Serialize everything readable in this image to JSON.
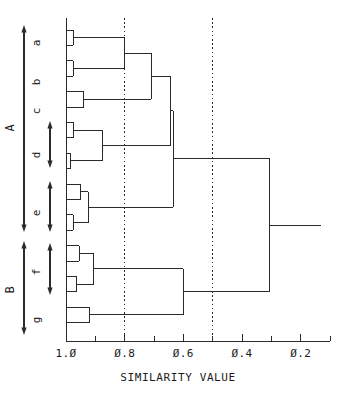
{
  "figure": {
    "type": "dendrogram",
    "background_color": "#ffffff",
    "line_color": "#2b2b2b",
    "width": 353,
    "height": 397
  },
  "axis": {
    "title": "SIMILARITY VALUE",
    "orientation": "horizontal-bottom",
    "direction": "decreasing-left-to-right",
    "tick_labels": [
      "1.0",
      "0.8",
      "0.6",
      "0.4",
      "0.2"
    ],
    "major_tick_values": [
      1.0,
      0.8,
      0.6,
      0.4,
      0.2
    ],
    "minor_tick_values": [
      0.9,
      0.7,
      0.5,
      0.3,
      0.1
    ],
    "axis_min": 1.0,
    "axis_max": 0.1,
    "zero_glyph": "slashed-zero"
  },
  "reference_lines": [
    {
      "name": "threshold-0-8",
      "value": 0.8,
      "style": "dotted"
    },
    {
      "name": "threshold-0-5",
      "value": 0.5,
      "style": "dotted"
    }
  ],
  "group_brackets": [
    {
      "label": "A",
      "name": "group-bracket-A",
      "style": "double-arrow"
    },
    {
      "label": "B",
      "name": "group-bracket-B",
      "style": "double-arrow"
    }
  ],
  "cluster_labels": [
    {
      "label": "a",
      "name": "cluster-label-a",
      "bracket": false
    },
    {
      "label": "b",
      "name": "cluster-label-b",
      "bracket": false
    },
    {
      "label": "c",
      "name": "cluster-label-c",
      "bracket": false
    },
    {
      "label": "d",
      "name": "cluster-label-d",
      "bracket": true
    },
    {
      "label": "e",
      "name": "cluster-label-e",
      "bracket": true
    },
    {
      "label": "f",
      "name": "cluster-label-f",
      "bracket": true
    },
    {
      "label": "g",
      "name": "cluster-label-g",
      "bracket": false
    }
  ],
  "chart_data": {
    "type": "line",
    "title": "",
    "subtitle": "",
    "xlabel": "SIMILARITY VALUE",
    "ylabel": "",
    "xlim": [
      1.0,
      0.1
    ],
    "ylim": [
      0,
      26
    ],
    "grid": false,
    "legend": "none",
    "x_ticks": [
      1.0,
      0.9,
      0.8,
      0.7,
      0.6,
      0.5,
      0.4,
      0.3,
      0.2,
      0.1
    ],
    "x_tick_labels": [
      "1.0",
      "",
      "0.8",
      "",
      "0.6",
      "",
      "0.4",
      "",
      "0.2",
      ""
    ],
    "leaves": [
      {
        "id": "L1",
        "group": "a",
        "slot": 0
      },
      {
        "id": "L2",
        "group": "a",
        "slot": 1
      },
      {
        "id": "L3",
        "group": "b",
        "slot": 2
      },
      {
        "id": "L4",
        "group": "b",
        "slot": 3
      },
      {
        "id": "L5",
        "group": "c",
        "slot": 4
      },
      {
        "id": "L6",
        "group": "c",
        "slot": 5
      },
      {
        "id": "L7",
        "group": "d",
        "slot": 6
      },
      {
        "id": "L8",
        "group": "d",
        "slot": 7
      },
      {
        "id": "L9",
        "group": "d",
        "slot": 8
      },
      {
        "id": "L10",
        "group": "d",
        "slot": 9
      },
      {
        "id": "L11",
        "group": "e",
        "slot": 10
      },
      {
        "id": "L12",
        "group": "e",
        "slot": 11
      },
      {
        "id": "L13",
        "group": "e",
        "slot": 12
      },
      {
        "id": "L14",
        "group": "e",
        "slot": 13
      },
      {
        "id": "L15",
        "group": "f",
        "slot": 14
      },
      {
        "id": "L16",
        "group": "f",
        "slot": 15
      },
      {
        "id": "L17",
        "group": "f",
        "slot": 16
      },
      {
        "id": "L18",
        "group": "f",
        "slot": 17
      },
      {
        "id": "L19",
        "group": "g",
        "slot": 18
      },
      {
        "id": "L20",
        "group": "g",
        "slot": 19
      }
    ],
    "merges": [
      {
        "id": "M1",
        "children": [
          "L1",
          "L2"
        ],
        "similarity": 0.975
      },
      {
        "id": "M2",
        "children": [
          "L3",
          "L4"
        ],
        "similarity": 0.975
      },
      {
        "id": "M3",
        "children": [
          "L5",
          "L6"
        ],
        "similarity": 0.94
      },
      {
        "id": "M4",
        "children": [
          "L7",
          "L8"
        ],
        "similarity": 0.975
      },
      {
        "id": "M5",
        "children": [
          "L9",
          "L10"
        ],
        "similarity": 0.985
      },
      {
        "id": "M6",
        "children": [
          "M4",
          "M5"
        ],
        "similarity": 0.875
      },
      {
        "id": "M7",
        "children": [
          "L11",
          "L12"
        ],
        "similarity": 0.95
      },
      {
        "id": "M8",
        "children": [
          "L13",
          "L14"
        ],
        "similarity": 0.975
      },
      {
        "id": "M9",
        "children": [
          "M7",
          "M8"
        ],
        "similarity": 0.925
      },
      {
        "id": "M10",
        "children": [
          "L15",
          "L16"
        ],
        "similarity": 0.955
      },
      {
        "id": "M11",
        "children": [
          "L17",
          "L18"
        ],
        "similarity": 0.965
      },
      {
        "id": "M12",
        "children": [
          "M10",
          "M11"
        ],
        "similarity": 0.905
      },
      {
        "id": "M13",
        "children": [
          "L19",
          "L20"
        ],
        "similarity": 0.92
      },
      {
        "id": "M14",
        "children": [
          "M1",
          "M2"
        ],
        "similarity": 0.8
      },
      {
        "id": "M15",
        "children": [
          "M14",
          "M3"
        ],
        "similarity": 0.71
      },
      {
        "id": "M16",
        "children": [
          "M15",
          "M6"
        ],
        "similarity": 0.645
      },
      {
        "id": "M17",
        "children": [
          "M16",
          "M9"
        ],
        "similarity": 0.635
      },
      {
        "id": "M18",
        "children": [
          "M12",
          "M13"
        ],
        "similarity": 0.6
      },
      {
        "id": "M19",
        "children": [
          "M17",
          "M18"
        ],
        "similarity": 0.305
      }
    ],
    "root": "M19",
    "root_stub_end": 0.13
  }
}
